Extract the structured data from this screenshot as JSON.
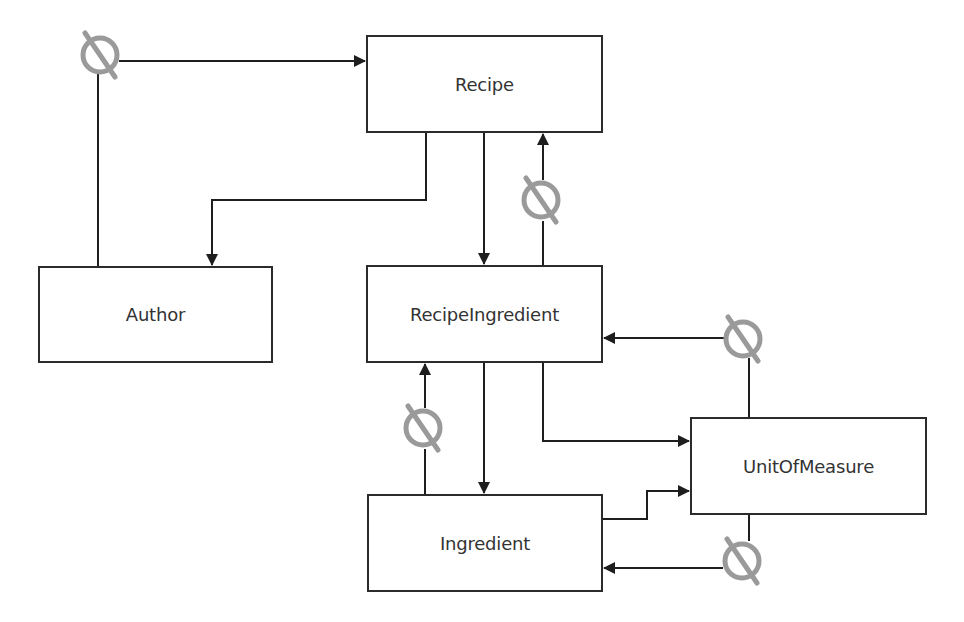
{
  "diagram": {
    "type": "entity-relationship",
    "colors": {
      "line": "#1e1e1e",
      "box_border": "#2b2b2b",
      "text": "#333333",
      "null_marker": "#9a9a9a"
    },
    "entities": [
      {
        "id": "recipe",
        "label": "Recipe",
        "x": 366,
        "y": 35,
        "w": 237,
        "h": 98
      },
      {
        "id": "author",
        "label": "Author",
        "x": 38,
        "y": 266,
        "w": 235,
        "h": 97
      },
      {
        "id": "recipe_ingredient",
        "label": "RecipeIngredient",
        "x": 366,
        "y": 265,
        "w": 237,
        "h": 98
      },
      {
        "id": "unit_of_measure",
        "label": "UnitOfMeasure",
        "x": 690,
        "y": 417,
        "w": 237,
        "h": 98
      },
      {
        "id": "ingredient",
        "label": "Ingredient",
        "x": 367,
        "y": 494,
        "w": 236,
        "h": 98
      }
    ],
    "relationships": [
      {
        "from": "author",
        "to": "recipe",
        "optional": true,
        "null_marker": [
          100,
          55
        ]
      },
      {
        "from": "recipe",
        "to": "author",
        "optional": false
      },
      {
        "from": "recipe",
        "to": "recipe_ingredient",
        "optional": false
      },
      {
        "from": "recipe_ingredient",
        "to": "recipe",
        "optional": true,
        "null_marker": [
          541,
          200
        ]
      },
      {
        "from": "unit_of_measure",
        "to": "recipe_ingredient",
        "optional": true,
        "null_marker": [
          743,
          339
        ]
      },
      {
        "from": "recipe_ingredient",
        "to": "unit_of_measure",
        "optional": false
      },
      {
        "from": "ingredient",
        "to": "recipe_ingredient",
        "optional": true,
        "null_marker": [
          423,
          428
        ]
      },
      {
        "from": "recipe_ingredient",
        "to": "ingredient",
        "optional": false
      },
      {
        "from": "ingredient",
        "to": "unit_of_measure",
        "optional": false
      },
      {
        "from": "unit_of_measure",
        "to": "ingredient",
        "optional": true,
        "null_marker": [
          742,
          561
        ]
      }
    ],
    "legend": {
      "null_marker_meaning": "optional (nullable) relationship"
    }
  }
}
